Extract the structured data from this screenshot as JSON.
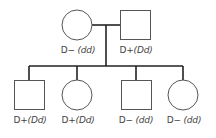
{
  "diagram": {
    "type": "pedigree",
    "colors": {
      "line": "#222222",
      "shape": "#555555",
      "text": "#444444"
    },
    "parents": [
      {
        "sex": "female",
        "phenotype": "D−",
        "genotype": "(dd)"
      },
      {
        "sex": "male",
        "phenotype": "D+",
        "genotype": "(Dd)"
      }
    ],
    "children": [
      {
        "sex": "male",
        "phenotype": "D+",
        "genotype": "(Dd)"
      },
      {
        "sex": "female",
        "phenotype": "D+",
        "genotype": "(Dd)"
      },
      {
        "sex": "male",
        "phenotype": "D−",
        "genotype": "(dd)"
      },
      {
        "sex": "female",
        "phenotype": "D−",
        "genotype": "(dd)"
      }
    ]
  }
}
